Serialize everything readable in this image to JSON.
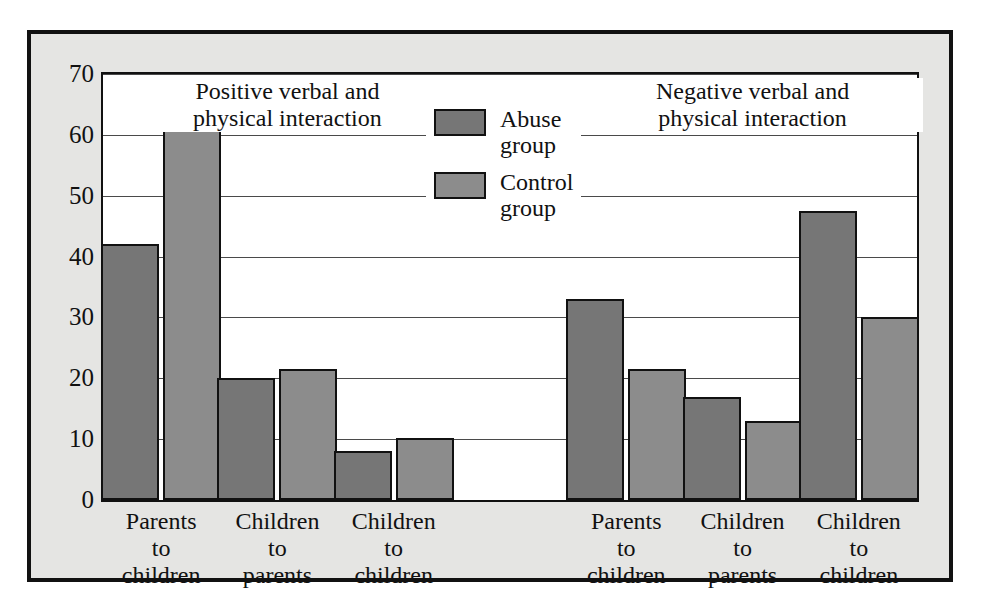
{
  "chart_data": {
    "type": "bar",
    "title": "",
    "xlabel": "",
    "ylabel": "",
    "ylim": [
      0,
      70
    ],
    "yticks": [
      0,
      10,
      20,
      30,
      40,
      50,
      60,
      70
    ],
    "grid": true,
    "legend_position": "top-center",
    "panels": [
      {
        "title_line1": "Positive verbal and",
        "title_line2": "physical interaction",
        "categories": [
          {
            "line1": "Parents",
            "line2": "to",
            "line3": "children"
          },
          {
            "line1": "Children",
            "line2": "to",
            "line3": "parents"
          },
          {
            "line1": "Children",
            "line2": "to",
            "line3": "children"
          }
        ],
        "series": [
          {
            "name": "Abuse group",
            "values": [
              42,
              20,
              8
            ]
          },
          {
            "name": "Control group",
            "values": [
              61.5,
              21.5,
              10.2
            ]
          }
        ]
      },
      {
        "title_line1": "Negative verbal and",
        "title_line2": "physical interaction",
        "categories": [
          {
            "line1": "Parents",
            "line2": "to",
            "line3": "children"
          },
          {
            "line1": "Children",
            "line2": "to",
            "line3": "parents"
          },
          {
            "line1": "Children",
            "line2": "to",
            "line3": "children"
          }
        ],
        "series": [
          {
            "name": "Abuse group",
            "values": [
              33,
              17,
              47.5
            ]
          },
          {
            "name": "Control group",
            "values": [
              21.5,
              13,
              30
            ]
          }
        ]
      }
    ],
    "legend": [
      {
        "label_line1": "Abuse",
        "label_line2": "group",
        "color": "#767676"
      },
      {
        "label_line1": "Control",
        "label_line2": "group",
        "color": "#8c8c8c"
      }
    ],
    "colors": {
      "abuse": "#767676",
      "control": "#8c8c8c",
      "panel_background": "#e5e5e3",
      "plot_background": "#ffffff",
      "axis": "#111111",
      "gridline": "#4a4a4a"
    }
  }
}
